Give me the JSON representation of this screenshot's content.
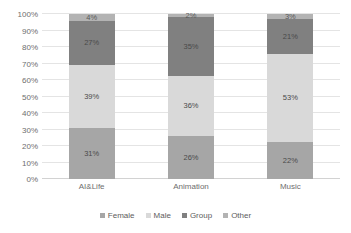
{
  "chart_data": {
    "type": "bar",
    "stacked": true,
    "stack_mode": "percent",
    "title": "",
    "xlabel": "",
    "ylabel": "",
    "ylim": [
      0,
      100
    ],
    "grid": true,
    "legend_position": "bottom",
    "categories": [
      "AI&Life",
      "Animation",
      "Music"
    ],
    "y_ticks": [
      "0%",
      "10%",
      "20%",
      "30%",
      "40%",
      "50%",
      "60%",
      "70%",
      "80%",
      "90%",
      "100%"
    ],
    "y_tick_values": [
      0,
      10,
      20,
      30,
      40,
      50,
      60,
      70,
      80,
      90,
      100
    ],
    "series": [
      {
        "name": "Female",
        "color": "#a6a6a6",
        "values": [
          31,
          26,
          22
        ],
        "labels": [
          "31%",
          "26%",
          "22%"
        ]
      },
      {
        "name": "Male",
        "color": "#d9d9d9",
        "values": [
          39,
          36,
          53
        ],
        "labels": [
          "39%",
          "36%",
          "53%"
        ]
      },
      {
        "name": "Group",
        "color": "#808080",
        "values": [
          27,
          35,
          21
        ],
        "labels": [
          "27%",
          "35%",
          "21%"
        ]
      },
      {
        "name": "Other",
        "color": "#b3b3b3",
        "values": [
          4,
          2,
          3
        ],
        "labels": [
          "4%",
          "2%",
          "3%"
        ]
      }
    ]
  },
  "legend": {
    "items": [
      {
        "label": "Female",
        "color": "#a6a6a6"
      },
      {
        "label": "Male",
        "color": "#d9d9d9"
      },
      {
        "label": "Group",
        "color": "#808080"
      },
      {
        "label": "Other",
        "color": "#b3b3b3"
      }
    ]
  }
}
